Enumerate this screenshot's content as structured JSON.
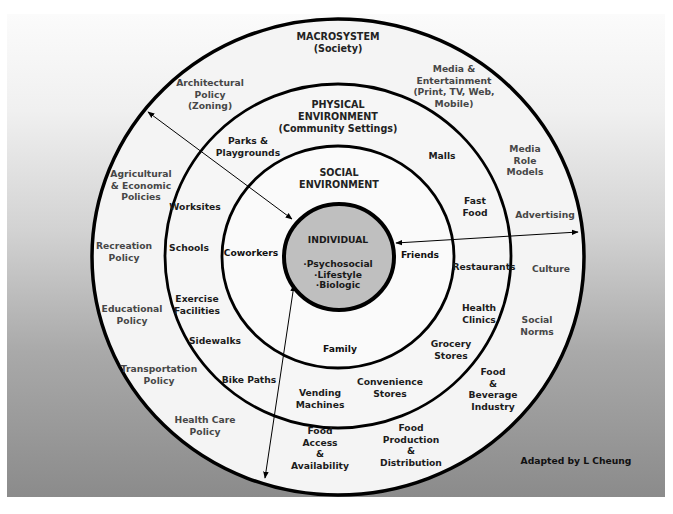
{
  "diagram": {
    "type": "socio-ecological model (concentric circles)",
    "colors": {
      "panel_top": "#fbfbfb",
      "panel_bottom": "#8b8b8b",
      "ring_fill": "#f4f4f4",
      "core_fill": "#bfbfbf",
      "stroke": "#000000"
    },
    "macrosystem": {
      "title": "MACROSYSTEM",
      "subtitle": "(Society)",
      "items": [
        {
          "id": "architectural-policy",
          "lines": [
            "Architectural",
            "Policy",
            "(Zoning)"
          ]
        },
        {
          "id": "agricultural-economic-policies",
          "lines": [
            "Agricultural",
            "& Economic",
            "Policies"
          ]
        },
        {
          "id": "recreation-policy",
          "lines": [
            "Recreation",
            "Policy"
          ]
        },
        {
          "id": "educational-policy",
          "lines": [
            "Educational",
            "Policy"
          ]
        },
        {
          "id": "transportation-policy",
          "lines": [
            "Transportation",
            "Policy"
          ]
        },
        {
          "id": "health-care-policy",
          "lines": [
            "Health Care",
            "Policy"
          ]
        },
        {
          "id": "food-access-availability",
          "lines": [
            "Food",
            "Access",
            "&",
            "Availability"
          ]
        },
        {
          "id": "food-production-distribution",
          "lines": [
            "Food",
            "Production",
            "&",
            "Distribution"
          ]
        },
        {
          "id": "food-beverage-industry",
          "lines": [
            "Food",
            "&",
            "Beverage",
            "Industry"
          ]
        },
        {
          "id": "social-norms",
          "lines": [
            "Social",
            "Norms"
          ]
        },
        {
          "id": "culture",
          "lines": [
            "Culture"
          ]
        },
        {
          "id": "advertising",
          "lines": [
            "Advertising"
          ]
        },
        {
          "id": "media-role-models",
          "lines": [
            "Media",
            "Role",
            "Models"
          ]
        },
        {
          "id": "media-entertainment",
          "lines": [
            "Media &",
            "Entertainment",
            "(Print, TV, Web,",
            "Mobile)"
          ]
        }
      ]
    },
    "physical_environment": {
      "title": "PHYSICAL",
      "title2": "ENVIRONMENT",
      "subtitle": "(Community Settings)",
      "items": [
        {
          "id": "parks-playgrounds",
          "lines": [
            "Parks &",
            "Playgrounds"
          ]
        },
        {
          "id": "worksites",
          "lines": [
            "Worksites"
          ]
        },
        {
          "id": "schools",
          "lines": [
            "Schools"
          ]
        },
        {
          "id": "exercise-facilities",
          "lines": [
            "Exercise",
            "Facilities"
          ]
        },
        {
          "id": "sidewalks",
          "lines": [
            "Sidewalks"
          ]
        },
        {
          "id": "bike-paths",
          "lines": [
            "Bike Paths"
          ]
        },
        {
          "id": "vending-machines",
          "lines": [
            "Vending",
            "Machines"
          ]
        },
        {
          "id": "convenience-stores",
          "lines": [
            "Convenience",
            "Stores"
          ]
        },
        {
          "id": "grocery-stores",
          "lines": [
            "Grocery",
            "Stores"
          ]
        },
        {
          "id": "health-clinics",
          "lines": [
            "Health",
            "Clinics"
          ]
        },
        {
          "id": "restaurants",
          "lines": [
            "Restaurants"
          ]
        },
        {
          "id": "fast-food",
          "lines": [
            "Fast",
            "Food"
          ]
        },
        {
          "id": "malls",
          "lines": [
            "Malls"
          ]
        }
      ]
    },
    "social_environment": {
      "title": "SOCIAL",
      "title2": "ENVIRONMENT",
      "items": [
        {
          "id": "coworkers",
          "lines": [
            "Coworkers"
          ]
        },
        {
          "id": "friends",
          "lines": [
            "Friends"
          ]
        },
        {
          "id": "family",
          "lines": [
            "Family"
          ]
        }
      ]
    },
    "individual": {
      "title": "INDIVIDUAL",
      "factors": [
        "·Psychosocial",
        "·Lifestyle",
        "·Biologic"
      ]
    },
    "credit": "Adapted by L Cheung",
    "arrows": 3
  }
}
